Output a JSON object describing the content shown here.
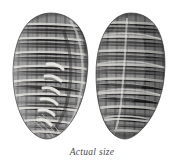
{
  "figure": {
    "kind": "natural-history-plate",
    "views": [
      {
        "id": "ventral",
        "label": "ventral-aperture-view",
        "description": "Shell seen from the aperture side, showing narrow slit-like aperture and a series of oblique light columellar folds (plaits) along the inner lip.",
        "position": {
          "x": 13,
          "y": 13,
          "width": 76,
          "height": 126
        }
      },
      {
        "id": "dorsal",
        "label": "dorsal-view",
        "description": "Shell seen from the back, showing a crosshatched plaid pattern of light spiral lines crossing darker axial bands.",
        "position": {
          "x": 96,
          "y": 13,
          "width": 70,
          "height": 126
        }
      }
    ]
  },
  "caption": {
    "text": "Actual size"
  },
  "colors": {
    "background": "#ffffff",
    "shell_mid": "#8f8f8f",
    "shell_light": "#e6e4e0",
    "shell_dark": "#3a3a3a",
    "shell_shadow": "#2a2a2a",
    "caption_text": "#4a4a4a"
  }
}
